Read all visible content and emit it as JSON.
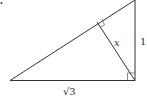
{
  "diagram": {
    "type": "right-triangle-with-altitude",
    "labels": {
      "altitude": "x",
      "vertical_leg": "1",
      "horizontal_leg": "√3"
    },
    "colors": {
      "stroke": "#333333",
      "background": "#ffffff"
    }
  }
}
